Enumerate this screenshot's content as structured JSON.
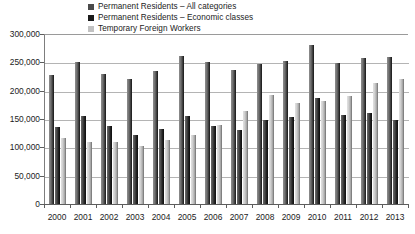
{
  "chart_data": {
    "type": "bar",
    "title": "",
    "subtitle": "",
    "xlabel": "",
    "ylabel": "",
    "grid": true,
    "legend_position": "top-center",
    "ylim": [
      0,
      300000
    ],
    "ytick_labels": [
      "300,000",
      "250,000",
      "200,000",
      "150,000",
      "100,000",
      "50,000",
      "0"
    ],
    "ytick_values": [
      300000,
      250000,
      200000,
      150000,
      100000,
      50000,
      0
    ],
    "categories": [
      "2000",
      "2001",
      "2002",
      "2003",
      "2004",
      "2005",
      "2006",
      "2007",
      "2008",
      "2009",
      "2010",
      "2011",
      "2012",
      "2013"
    ],
    "series": [
      {
        "name": "Permanent Residents – All categories",
        "color": "#4a4a4a",
        "values": [
          227000,
          250000,
          229000,
          221000,
          235000,
          262000,
          251000,
          236000,
          247000,
          252000,
          280000,
          249000,
          257000,
          259000
        ]
      },
      {
        "name": "Permanent Residents – Economic classes",
        "color": "#1a1a1a",
        "values": [
          136000,
          155000,
          138000,
          121000,
          133000,
          156000,
          138000,
          131000,
          149000,
          153000,
          187000,
          157000,
          161000,
          148000
        ]
      },
      {
        "name": "Temporary Foreign Workers",
        "color": "#c2c2c2",
        "values": [
          116000,
          110000,
          109000,
          103000,
          113000,
          122000,
          139000,
          165000,
          192000,
          178000,
          182000,
          190000,
          213000,
          221000
        ]
      }
    ]
  },
  "legend": {
    "items": [
      {
        "label": "Permanent Residents – All categories",
        "swatch": "legend-swatch-all"
      },
      {
        "label": "Permanent Residents – Economic classes",
        "swatch": "legend-swatch-economic"
      },
      {
        "label": "Temporary Foreign Workers",
        "swatch": "legend-swatch-tfw"
      }
    ]
  }
}
